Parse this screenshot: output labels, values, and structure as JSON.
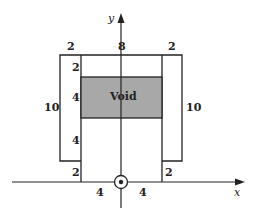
{
  "diagram": {
    "axes": {
      "x_label": "x",
      "y_label": "y"
    },
    "void_label": "Void",
    "dimensions": {
      "top_left_width": "2",
      "top_center_width": "8",
      "top_right_width": "2",
      "inner_top_gap": "2",
      "void_height": "4",
      "inner_lower_height": "4",
      "inner_bottom_gap_left": "2",
      "inner_bottom_gap_right": "2",
      "outer_left_height": "10",
      "outer_right_height": "10",
      "bottom_left_half": "4",
      "bottom_right_half": "4"
    },
    "colors": {
      "line": "#222222",
      "void_fill": "#a8a8a8",
      "background": "#ffffff"
    }
  }
}
